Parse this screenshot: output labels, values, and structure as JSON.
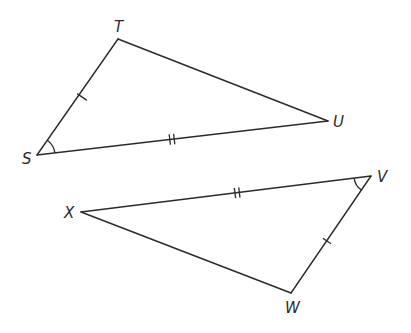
{
  "diagram": {
    "type": "congruent-triangles",
    "stroke_color": "#2b2b2b",
    "background": "#ffffff",
    "triangles": [
      {
        "name": "triangle-STU",
        "vertices": [
          {
            "label": "T",
            "x": 118,
            "y": 39,
            "label_x": 114,
            "label_y": 32
          },
          {
            "label": "S",
            "x": 37,
            "y": 155,
            "label_x": 22,
            "label_y": 164
          },
          {
            "label": "U",
            "x": 328,
            "y": 121,
            "label_x": 333,
            "label_y": 127
          }
        ],
        "edges": [
          {
            "from": "S",
            "to": "T",
            "ticks": 1
          },
          {
            "from": "T",
            "to": "U",
            "ticks": 0
          },
          {
            "from": "S",
            "to": "U",
            "ticks": 2
          }
        ],
        "angle_mark": {
          "vertex": "S",
          "radius": 18
        }
      },
      {
        "name": "triangle-XVW",
        "vertices": [
          {
            "label": "X",
            "x": 81,
            "y": 212,
            "label_x": 64,
            "label_y": 218
          },
          {
            "label": "V",
            "x": 371,
            "y": 176,
            "label_x": 377,
            "label_y": 182
          },
          {
            "label": "W",
            "x": 291,
            "y": 293,
            "label_x": 285,
            "label_y": 313
          }
        ],
        "edges": [
          {
            "from": "X",
            "to": "V",
            "ticks": 2
          },
          {
            "from": "V",
            "to": "W",
            "ticks": 1
          },
          {
            "from": "X",
            "to": "W",
            "ticks": 0
          }
        ],
        "angle_mark": {
          "vertex": "V",
          "radius": 17
        }
      }
    ]
  },
  "labels": {
    "T": "T",
    "S": "S",
    "U": "U",
    "X": "X",
    "V": "V",
    "W": "W"
  }
}
